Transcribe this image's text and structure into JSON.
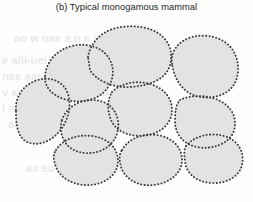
{
  "panel": {
    "caption": "(b) Typical monogamous mammal",
    "label": "b",
    "title": "Typical monogamous mammal"
  },
  "colors": {
    "background": "#fefefe",
    "cell_fill": "#e3e3e3",
    "cell_outline": "#3a3a3a",
    "caption_text": "#231f20",
    "watermark_text": "#b9b9bb"
  },
  "watermark": {
    "note": "faint page bleed-through text, largely illegible",
    "lines": [
      {
        "text": "e alli-uei Seu/",
        "x": 2,
        "y": 60
      },
      {
        "text": "nes  aasonne  e sa",
        "x": 2,
        "y": 76
      },
      {
        "text": "v  asuni  a  sie pi uu u",
        "x": 2,
        "y": 92
      },
      {
        "text": "i  nh  aa  ies  saanu  u  ji pi ee uii",
        "x": 2,
        "y": 108
      },
      {
        "text": "ao w  nae  a n e iu ea",
        "x": 14,
        "y": 36
      },
      {
        "text": "aes  i   nea  a  n sa i  ee",
        "x": 8,
        "y": 124
      },
      {
        "text": "as  eu  a  au u ns es",
        "x": 26,
        "y": 168
      }
    ]
  },
  "chart_data": {
    "type": "diagram",
    "subtype": "territory-cluster",
    "title": "(b) Typical monogamous mammal",
    "cell_count": 10,
    "cells": [
      {
        "id": "cell-top-center",
        "name": "top-center-territory",
        "fill": "#e3e3e3",
        "path": "M 88 57 C 90 44 100 32 116 28 C 133 24 152 27 162 36 C 172 45 173 58 169 68 C 164 80 148 86 130 87 C 112 88 96 80 90 70 Z"
      },
      {
        "id": "cell-top-right",
        "name": "top-right-territory",
        "fill": "#e3e3e3",
        "path": "M 172 64 C 170 52 178 41 192 37 C 208 33 224 38 232 49 C 240 60 240 76 233 86 C 226 96 210 100 196 96 C 182 92 174 78 172 64 Z"
      },
      {
        "id": "cell-upper-left",
        "name": "upper-left-territory",
        "fill": "#e3e3e3",
        "path": "M 45 76 C 46 62 56 50 72 46 C 88 42 104 48 110 60 C 116 72 112 84 104 92 C 95 101 78 104 64 99 C 52 95 44 87 45 76 Z"
      },
      {
        "id": "cell-mid-center",
        "name": "middle-center-territory",
        "fill": "#e3e3e3",
        "path": "M 112 92 C 121 83 136 80 150 84 C 164 88 172 98 172 110 C 172 122 163 132 148 135 C 133 138 118 133 112 122 C 107 112 107 100 112 92 Z"
      },
      {
        "id": "cell-mid-right",
        "name": "middle-right-territory",
        "fill": "#e3e3e3",
        "path": "M 180 100 C 192 94 210 95 222 102 C 234 109 238 122 233 133 C 228 144 212 150 197 147 C 183 144 175 134 175 121 C 175 112 176 104 180 100 Z"
      },
      {
        "id": "cell-far-left",
        "name": "far-left-territory",
        "fill": "#e3e3e3",
        "path": "M 16 110 C 15 96 24 84 38 80 C 52 76 64 82 68 94 C 72 107 68 122 58 133 C 48 144 33 147 24 140 C 16 133 16 120 16 110 Z"
      },
      {
        "id": "cell-center-left",
        "name": "center-left-territory",
        "fill": "#e3e3e3",
        "path": "M 62 120 C 66 108 78 100 92 100 C 106 100 116 108 118 121 C 120 134 113 146 100 151 C 86 156 71 152 65 142 C 60 134 60 126 62 120 Z"
      },
      {
        "id": "cell-bottom-left",
        "name": "bottom-left-territory",
        "fill": "#e3e3e3",
        "path": "M 56 150 C 62 140 76 134 92 136 C 108 138 118 148 118 161 C 118 174 106 184 90 185 C 74 186 60 178 56 167 C 53 159 53 154 56 150 Z"
      },
      {
        "id": "cell-bottom-center",
        "name": "bottom-center-territory",
        "fill": "#e3e3e3",
        "path": "M 122 150 C 128 139 142 133 157 135 C 172 137 182 147 182 160 C 182 173 170 183 154 185 C 138 187 125 179 121 167 C 119 160 119 154 122 150 Z"
      },
      {
        "id": "cell-bottom-right",
        "name": "bottom-right-territory",
        "fill": "#e3e3e3",
        "path": "M 186 146 C 194 136 210 132 224 136 C 238 140 245 152 242 165 C 239 177 226 184 211 183 C 196 182 186 173 185 161 C 184 153 184 149 186 146 Z"
      }
    ]
  }
}
